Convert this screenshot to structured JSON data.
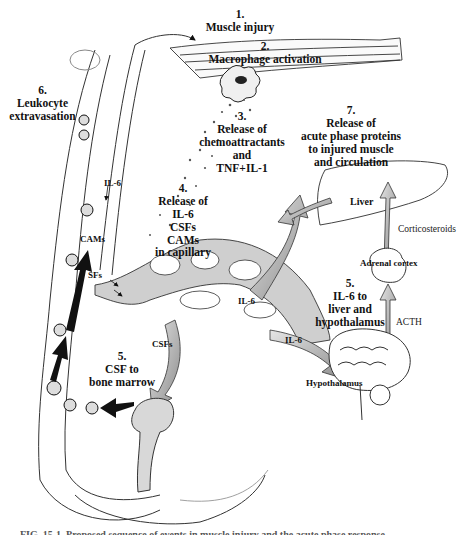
{
  "diagram": {
    "type": "physiological process flow",
    "steps": [
      {
        "number": "1.",
        "lines": [
          "Muscle injury"
        ]
      },
      {
        "number": "2.",
        "lines": [
          "Macrophage activation"
        ]
      },
      {
        "number": "3.",
        "lines": [
          "Release of",
          "chemoattractants",
          "and",
          "TNF+IL-1"
        ]
      },
      {
        "number": "4.",
        "lines": [
          "Release of",
          "IL-6",
          "CSFs",
          "CAMs",
          "in capillary"
        ]
      },
      {
        "number": "5.",
        "lines": [
          "IL-6 to",
          "liver and",
          "hypothalamus"
        ]
      },
      {
        "number": "5.",
        "lines": [
          "CSF to",
          "bone marrow"
        ]
      },
      {
        "number": "6.",
        "lines": [
          "Leukocyte",
          "extravasation"
        ]
      },
      {
        "number": "7.",
        "lines": [
          "Release of",
          "acute phase proteins",
          "to injured muscle",
          "and circulation"
        ]
      }
    ],
    "labels": {
      "il6_vessel": "IL-6",
      "cams": "CAMs",
      "sfs": "SFs",
      "csfs_capillary": "CSFs",
      "il6_upper": "IL-6",
      "il6_lower": "IL-6",
      "liver": "Liver",
      "corticosteroids": "Corticosteroids",
      "adrenal_cortex": "Adrenal cortex",
      "acth": "ACTH",
      "hypothalamus": "Hypothalamus"
    },
    "caption": "FIG. 15-1. Proposed sequence of events in muscle injury and the acute phase response"
  }
}
